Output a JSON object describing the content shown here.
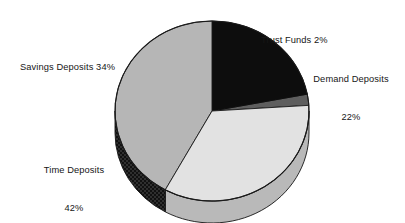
{
  "chart_data": {
    "type": "pie",
    "title": "",
    "subtitle": "",
    "xlabel": "",
    "ylabel": "",
    "legend_position": "none",
    "grid": false,
    "three_d": true,
    "units": "percent",
    "total": 100,
    "categories": [
      "Demand Deposits",
      "Trust Funds",
      "Savings Deposits",
      "Time Deposits"
    ],
    "values": [
      22,
      2,
      34,
      42
    ],
    "slices": [
      {
        "name": "demand-deposits",
        "label": "Demand Deposits",
        "value_text": "22%",
        "value": 22,
        "color": "#0d0d0d",
        "side_color": "#000000",
        "fill_style": "solid"
      },
      {
        "name": "trust-funds",
        "label": "Trust Funds",
        "value_text": "2%",
        "value": 2,
        "color": "#5e5e5e",
        "side_color": "#3d3d3d",
        "fill_style": "solid"
      },
      {
        "name": "savings-deposits",
        "label": "Savings Deposits",
        "value_text": "34%",
        "value": 34,
        "color": "#e2e2e2",
        "side_color": "#b9b9b9",
        "fill_style": "solid"
      },
      {
        "name": "time-deposits",
        "label": "Time Deposits",
        "value_text": "42%",
        "value": 42,
        "color": "#b6b6b6",
        "side_color": "#2b2b2b",
        "fill_style": "checkerboard"
      }
    ]
  },
  "labels": {
    "trust_funds": {
      "line1": "Trust Funds 2%"
    },
    "demand_deposits": {
      "line1": "Demand Deposits",
      "line2": "22%"
    },
    "savings_deposits": {
      "line1": "Savings Deposits 34%"
    },
    "time_deposits": {
      "line1": "Time Deposits",
      "line2": "42%"
    }
  },
  "style": {
    "background": "#ffffff",
    "text_color": "#161616",
    "outline_color": "#1a1a1a"
  }
}
